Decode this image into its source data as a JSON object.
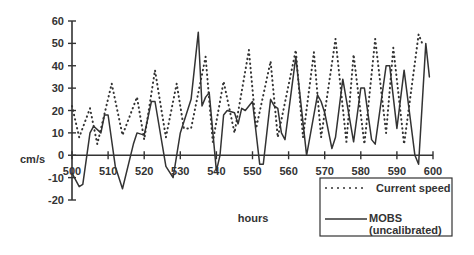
{
  "chart_data": {
    "type": "line",
    "title": "",
    "xlabel": "hours",
    "ylabel": "cm/s",
    "xlim": [
      500,
      600
    ],
    "ylim": [
      -20,
      60
    ],
    "x_ticks": [
      500,
      510,
      520,
      530,
      540,
      550,
      560,
      570,
      580,
      590,
      600
    ],
    "y_ticks": [
      -20,
      -10,
      0,
      10,
      20,
      30,
      40,
      50,
      60
    ],
    "grid": false,
    "legend_position": "lower right",
    "series": [
      {
        "name": "Current speed",
        "style": "dotted",
        "x": [
          500,
          502,
          505,
          507,
          511,
          514,
          518,
          520,
          523,
          526,
          529,
          531,
          533,
          537,
          539,
          542,
          545,
          549,
          551,
          555,
          557,
          562,
          564,
          567,
          569,
          573,
          576,
          578,
          581,
          584,
          587,
          589,
          592,
          596,
          597
        ],
        "y": [
          22,
          8,
          21,
          5,
          32,
          9,
          26,
          7,
          38,
          8,
          32,
          12,
          12,
          44,
          6,
          33,
          10,
          47,
          12,
          42,
          8,
          47,
          8,
          46,
          8,
          52,
          6,
          45,
          5,
          52,
          10,
          48,
          5,
          54,
          50
        ]
      },
      {
        "name": "MOBS (uncalibrated)",
        "style": "solid",
        "x": [
          500,
          502,
          503,
          505,
          506,
          508,
          509,
          510,
          512,
          514,
          517,
          518,
          520,
          522,
          523,
          526,
          528,
          530,
          533,
          535,
          536,
          537,
          538,
          540,
          541,
          542,
          543,
          545,
          546,
          547,
          548,
          550,
          552,
          553,
          555,
          556,
          557,
          558,
          559,
          562,
          565,
          568,
          569,
          570,
          572,
          573,
          575,
          578,
          580,
          581,
          583,
          584,
          587,
          588,
          590,
          592,
          595,
          596,
          598,
          599
        ],
        "y": [
          -8,
          -14,
          -13,
          10,
          13,
          10,
          18,
          18,
          -5,
          -15,
          5,
          10,
          9,
          24,
          24,
          -5,
          -10,
          10,
          25,
          55,
          22,
          26,
          28,
          -7,
          0,
          18,
          20,
          19,
          14,
          21,
          20,
          24,
          -4,
          -4,
          25,
          22,
          21,
          10,
          7,
          44,
          0,
          27,
          24,
          19,
          3,
          8,
          34,
          6,
          30,
          30,
          7,
          5,
          40,
          40,
          12,
          38,
          0,
          -4,
          50,
          35
        ]
      }
    ]
  },
  "labels": {
    "ylabel": "cm/s",
    "xlabel": "hours",
    "legend": {
      "current_speed": "Current speed",
      "mobs_line1": "MOBS",
      "mobs_line2": "(uncalibrated)"
    }
  }
}
